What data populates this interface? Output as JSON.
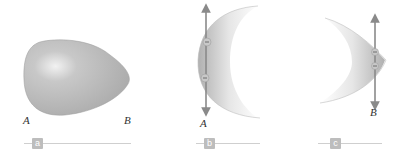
{
  "figure": {
    "panels": [
      {
        "id": "a",
        "badge": "a",
        "point_labels": [
          "A",
          "B"
        ],
        "description": "Egg-shaped conductor, blunt end A, pointed end B"
      },
      {
        "id": "b",
        "badge": "b",
        "point_labels": [
          "A"
        ],
        "description": "Blunt end A: charges spread, field vectors along surface"
      },
      {
        "id": "c",
        "badge": "c",
        "point_labels": [
          "B"
        ],
        "description": "Pointed end B: charges close together"
      }
    ],
    "colors": {
      "shape_fill": "#b8b8b8",
      "arrow": "#8a8a8a",
      "badge": "#bdbdbd",
      "line": "#cfcfcf"
    }
  }
}
